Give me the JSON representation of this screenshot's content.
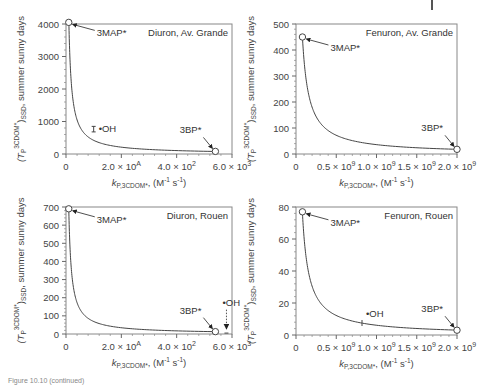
{
  "caption": "Figure 10.10 (continued)",
  "chart_data": [
    {
      "type": "line",
      "title": "Diuron, Av. Grande",
      "ylabel_parts": [
        "(T",
        "P",
        "3CDOM*",
        ")",
        "SSD",
        ", summer sunny days"
      ],
      "xlabel_parts": [
        "k",
        "P,3CDOM*",
        ", (M",
        "-1",
        " s",
        "-1",
        ")"
      ],
      "xlim": [
        0,
        6000
      ],
      "ylim": [
        0,
        4000
      ],
      "xticks": [
        0,
        2000,
        4000,
        6000
      ],
      "xtick_labels": [
        "0",
        "2.0 × 10^A",
        "4.0 × 10^2",
        "6.0 × 10^3"
      ],
      "yticks": [
        0,
        1000,
        2000,
        3000,
        4000
      ],
      "ytick_labels": [
        "0",
        "1000",
        "2000",
        "3000",
        "4000"
      ],
      "curve": {
        "k_const": 420000,
        "x_start": 100,
        "x_end": 5300
      },
      "points": [
        {
          "label": "3MAP*",
          "x": 100,
          "y": 4050,
          "marker": "circle"
        },
        {
          "label": "3BP*",
          "x": 5400,
          "y": 80,
          "marker": "circle"
        }
      ],
      "oh": {
        "label": "•OH",
        "x": 1000,
        "y_low": 680,
        "y_high": 850,
        "marker": "errorbar"
      }
    },
    {
      "type": "line",
      "title": "Fenuron, Av. Grande",
      "ylabel_parts": [
        "(T",
        "P",
        "3CDOM*",
        ")",
        "SSD",
        ", summer sunny days"
      ],
      "xlabel_parts": [
        "k",
        "P,3CDOM*",
        ", (M",
        "-1",
        " s",
        "-1",
        ")"
      ],
      "xlim": [
        0,
        2000000000.0
      ],
      "ylim": [
        0,
        500
      ],
      "xticks": [
        0,
        500000000.0,
        1000000000.0,
        1500000000.0,
        2000000000.0
      ],
      "xtick_labels": [
        "0",
        "0.5 × 10^9",
        "1.0 × 10^9",
        "1.5 × 10^9",
        "2.0 × 10^9"
      ],
      "yticks": [
        0,
        100,
        200,
        300,
        400,
        500
      ],
      "ytick_labels": [
        "0",
        "100",
        "200",
        "300",
        "400",
        "500"
      ],
      "curve": {
        "k_const": 36000000000.0,
        "x_start": 80000000.0,
        "x_end": 2000000000.0
      },
      "points": [
        {
          "label": "3MAP*",
          "x": 80000000.0,
          "y": 450,
          "marker": "circle"
        },
        {
          "label": "3BP*",
          "x": 2000000000.0,
          "y": 18,
          "marker": "circle"
        }
      ]
    },
    {
      "type": "line",
      "title": "Diuron, Rouen",
      "ylabel_parts": [
        "(T",
        "P",
        "3CDOM*",
        ")",
        "SSD",
        ", summer sunny days"
      ],
      "xlabel_parts": [
        "k",
        "P,3CDOM*",
        ", (M",
        "-1",
        " s",
        "-1",
        ")"
      ],
      "xlim": [
        0,
        6000
      ],
      "ylim": [
        0,
        700
      ],
      "xticks": [
        0,
        2000,
        4000,
        6000
      ],
      "xtick_labels": [
        "0",
        "2.0 × 10^A",
        "4.0 × 10^2",
        "6.0 × 10^3"
      ],
      "yticks": [
        0,
        100,
        200,
        300,
        400,
        500,
        600,
        700
      ],
      "ytick_labels": [
        "0",
        "100",
        "200",
        "300",
        "400",
        "500",
        "600",
        "700"
      ],
      "curve": {
        "k_const": 69000,
        "x_start": 100,
        "x_end": 5300
      },
      "points": [
        {
          "label": "3MAP*",
          "x": 100,
          "y": 690,
          "marker": "circle"
        },
        {
          "label": "3BP*",
          "x": 5400,
          "y": 13,
          "marker": "circle"
        }
      ],
      "oh": {
        "label": "•OH",
        "x": 5800,
        "y_low": 5,
        "y_high": 13,
        "marker": "dotted-arrow"
      }
    },
    {
      "type": "line",
      "title": "Fenuron, Rouen",
      "ylabel_parts": [
        "(T",
        "P",
        "3CDOM*",
        ")",
        "SSD",
        ", summer sunny days"
      ],
      "xlabel_parts": [
        "k",
        "P,3CDOM*",
        ", (M",
        "-1",
        " s",
        "-1",
        ")"
      ],
      "xlim": [
        0,
        2000000000.0
      ],
      "ylim": [
        0,
        80
      ],
      "xticks": [
        0,
        500000000.0,
        1000000000.0,
        1500000000.0,
        2000000000.0
      ],
      "xtick_labels": [
        "0",
        "0.5 × 10^9",
        "1.0 × 10^9",
        "1.5 × 10^9",
        "2.0 × 10^9"
      ],
      "yticks": [
        0,
        20,
        40,
        60,
        80
      ],
      "ytick_labels": [
        "0",
        "20",
        "40",
        "60",
        "80"
      ],
      "curve": {
        "k_const": 6100000000.0,
        "x_start": 80000000.0,
        "x_end": 2000000000.0
      },
      "points": [
        {
          "label": "3MAP*",
          "x": 80000000.0,
          "y": 77,
          "marker": "circle"
        },
        {
          "label": "3BP*",
          "x": 2000000000.0,
          "y": 3,
          "marker": "circle"
        }
      ],
      "oh": {
        "label": "•OH",
        "x": 820000000.0,
        "y": 7.5,
        "marker": "tick"
      }
    }
  ]
}
